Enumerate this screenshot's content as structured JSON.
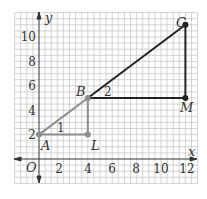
{
  "diagram": {
    "axes": {
      "x_label": "x",
      "y_label": "y",
      "origin_label": "O",
      "x_ticks": [
        "2",
        "4",
        "6",
        "8",
        "10",
        "12"
      ],
      "y_ticks": [
        "2",
        "4",
        "6",
        "8",
        "10"
      ]
    },
    "points": [
      {
        "name": "A",
        "x": 0,
        "y": 2
      },
      {
        "name": "B",
        "x": 4,
        "y": 5
      },
      {
        "name": "C",
        "x": 12,
        "y": 11
      },
      {
        "name": "L",
        "x": 4,
        "y": 2
      },
      {
        "name": "M",
        "x": 12,
        "y": 5
      }
    ],
    "triangles": [
      {
        "id": "1",
        "label": "1",
        "vertices": [
          "A",
          "B",
          "L"
        ],
        "color": "#8c8c8c"
      },
      {
        "id": "2",
        "label": "2",
        "vertices": [
          "B",
          "C",
          "M"
        ],
        "color": "#222222"
      }
    ],
    "colors": {
      "grid": "#c8c8c8",
      "axis": "#333333",
      "triangle1": "#8c8c8c",
      "triangle2": "#222222"
    }
  }
}
